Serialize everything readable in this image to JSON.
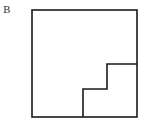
{
  "figure": {
    "label": "B",
    "stroke_color": "#1a1a1a",
    "outer_square": {
      "x1": 32,
      "y1": 10,
      "x2": 137,
      "y2": 117
    },
    "staircase_points": [
      [
        83,
        117
      ],
      [
        83,
        89
      ],
      [
        107,
        89
      ],
      [
        107,
        64
      ],
      [
        137,
        64
      ]
    ]
  }
}
